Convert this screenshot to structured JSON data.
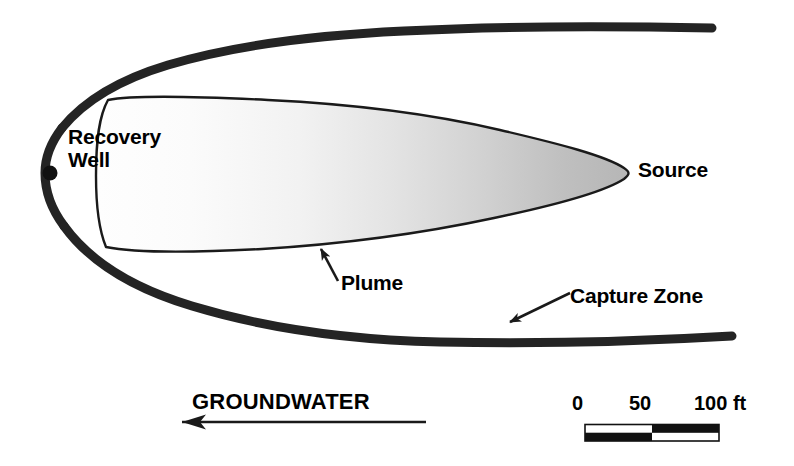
{
  "figure": {
    "type": "diagram",
    "background_color": "#ffffff",
    "ink_color": "#1a1a1a"
  },
  "labels": {
    "recovery_well_line1": "Recovery",
    "recovery_well_line2": "Well",
    "source": "Source",
    "plume": "Plume",
    "capture_zone": "Capture Zone",
    "groundwater": "GROUNDWATER"
  },
  "scale_bar": {
    "ticks": [
      "0",
      "50",
      "100 ft"
    ],
    "tick_values": [
      0,
      50,
      100
    ],
    "units": "ft",
    "segments": 2,
    "pattern": "checkerboard",
    "bar_left_px": 585,
    "bar_right_px": 719,
    "bar_top_px": 424,
    "bar_height_px": 17
  },
  "flow_arrow": {
    "direction": "left",
    "label": "GROUNDWATER",
    "tip_x": 178,
    "tail_x": 426,
    "y": 422
  },
  "geometry": {
    "capture_zone": {
      "name": "capture-zone-boundary",
      "stroke_color": "#222222",
      "stroke_width": 9,
      "fill": "none",
      "left_tip_x": 45,
      "left_tip_y": 172,
      "upper_end_x": 712,
      "upper_end_y": 27,
      "lower_end_x": 732,
      "lower_end_y": 338
    },
    "plume": {
      "name": "contaminant-plume",
      "stroke_color": "#1a1a1a",
      "stroke_width": 2.4,
      "fill_gradient_start": "#fdfdfd",
      "fill_gradient_end": "#b6b6b6",
      "left_x": 92,
      "right_tip_x": 630,
      "top_y": 95,
      "bottom_y": 252,
      "center_y": 172
    },
    "recovery_well": {
      "name": "recovery-well-point",
      "cx": 50,
      "cy": 173,
      "r": 7,
      "color": "#111111"
    }
  },
  "annotations": {
    "plume_leader": {
      "from_x": 337,
      "from_y": 280,
      "to_x": 323,
      "to_y": 251
    },
    "capture_zone_leader": {
      "from_x": 568,
      "from_y": 292,
      "to_x": 512,
      "to_y": 321
    }
  }
}
